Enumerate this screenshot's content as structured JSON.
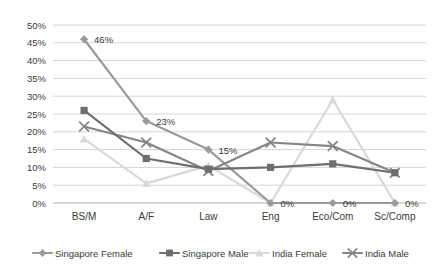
{
  "chart_data": {
    "type": "line",
    "title": "",
    "subtitle": "",
    "xlabel": "",
    "ylabel": "",
    "categories": [
      "BS/M",
      "A/F",
      "Law",
      "Eng",
      "Eco/Com",
      "Sc/Comp"
    ],
    "ylim": [
      0,
      50
    ],
    "ytick_values": [
      0,
      5,
      10,
      15,
      20,
      25,
      30,
      35,
      40,
      45,
      50
    ],
    "ytick_labels": [
      "0%",
      "5%",
      "10%",
      "15%",
      "20%",
      "25%",
      "30%",
      "35%",
      "40%",
      "45%",
      "50%"
    ],
    "grid": true,
    "legend_position": "bottom",
    "series": [
      {
        "name": "Singapore Female",
        "marker": "diamond",
        "color": "#9a9a9a",
        "values": [
          46,
          23,
          15,
          0,
          0,
          0
        ]
      },
      {
        "name": "Singapore Male",
        "marker": "square",
        "color": "#6e6e6e",
        "values": [
          26,
          12.5,
          9.5,
          10,
          11,
          8.5
        ]
      },
      {
        "name": "India  Female",
        "marker": "triangle",
        "color": "#d9d9d9",
        "values": [
          18,
          5.5,
          10.5,
          0,
          29,
          0
        ]
      },
      {
        "name": "India  Male",
        "marker": "cross",
        "color": "#868686",
        "values": [
          21.5,
          17,
          9,
          17,
          16,
          8.5
        ]
      }
    ],
    "annotations": [
      {
        "text": "46%",
        "series": "Singapore Female",
        "category": "BS/M",
        "value": 46
      },
      {
        "text": "23%",
        "series": "Singapore Female",
        "category": "A/F",
        "value": 23
      },
      {
        "text": "15%",
        "series": "Singapore Female",
        "category": "Law",
        "value": 15
      },
      {
        "text": "0%",
        "series": "Singapore Female",
        "category": "Eng",
        "value": 0
      },
      {
        "text": "0%",
        "series": "Singapore Female",
        "category": "Eco/Com",
        "value": 0
      },
      {
        "text": "0%",
        "series": "Singapore Female",
        "category": "Sc/Comp",
        "value": 0
      }
    ]
  },
  "legend": {
    "items": [
      {
        "label": "Singapore Female"
      },
      {
        "label": "Singapore Male"
      },
      {
        "label": "India  Female"
      },
      {
        "label": "India  Male"
      }
    ]
  }
}
